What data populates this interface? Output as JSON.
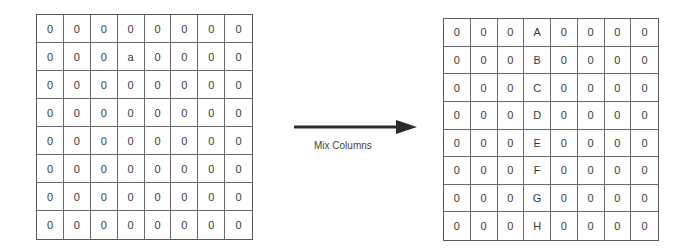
{
  "left_grid": {
    "rows": [
      [
        "0",
        "0",
        "0",
        "0",
        "0",
        "0",
        "0",
        "0"
      ],
      [
        "0",
        "0",
        "0",
        "a",
        "0",
        "0",
        "0",
        "0"
      ],
      [
        "0",
        "0",
        "0",
        "0",
        "0",
        "0",
        "0",
        "0"
      ],
      [
        "0",
        "0",
        "0",
        "0",
        "0",
        "0",
        "0",
        "0"
      ],
      [
        "0",
        "0",
        "0",
        "0",
        "0",
        "0",
        "0",
        "0"
      ],
      [
        "0",
        "0",
        "0",
        "0",
        "0",
        "0",
        "0",
        "0"
      ],
      [
        "0",
        "0",
        "0",
        "0",
        "0",
        "0",
        "0",
        "0"
      ],
      [
        "0",
        "0",
        "0",
        "0",
        "0",
        "0",
        "0",
        "0"
      ]
    ]
  },
  "arrow": {
    "label": "Mix Columns",
    "icon": "right-arrow-icon",
    "color": "#2b2b2b"
  },
  "right_grid": {
    "rows": [
      [
        "0",
        "0",
        "0",
        "A",
        "0",
        "0",
        "0",
        "0"
      ],
      [
        "0",
        "0",
        "0",
        "B",
        "0",
        "0",
        "0",
        "0"
      ],
      [
        "0",
        "0",
        "0",
        "C",
        "0",
        "0",
        "0",
        "0"
      ],
      [
        "0",
        "0",
        "0",
        "D",
        "0",
        "0",
        "0",
        "0"
      ],
      [
        "0",
        "0",
        "0",
        "E",
        "0",
        "0",
        "0",
        "0"
      ],
      [
        "0",
        "0",
        "0",
        "F",
        "0",
        "0",
        "0",
        "0"
      ],
      [
        "0",
        "0",
        "0",
        "G",
        "0",
        "0",
        "0",
        "0"
      ],
      [
        "0",
        "0",
        "0",
        "H",
        "0",
        "0",
        "0",
        "0"
      ]
    ]
  }
}
